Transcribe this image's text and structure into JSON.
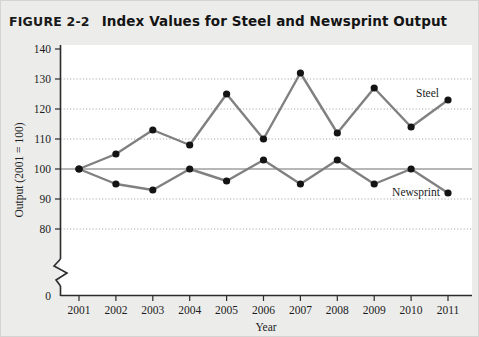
{
  "figure": {
    "number": "FIGURE 2-2",
    "title": "Index Values for Steel and Newsprint Output"
  },
  "chart_data": {
    "type": "line",
    "title": "Index Values for Steel and Newsprint Output",
    "xlabel": "Year",
    "ylabel": "Output (2001 = 100)",
    "categories": [
      "2001",
      "2002",
      "2003",
      "2004",
      "2005",
      "2006",
      "2007",
      "2008",
      "2009",
      "2010",
      "2011"
    ],
    "x": [
      2001,
      2002,
      2003,
      2004,
      2005,
      2006,
      2007,
      2008,
      2009,
      2010,
      2011
    ],
    "series": [
      {
        "name": "Steel",
        "color": "#808080",
        "marker_color": "#141414",
        "values": [
          100,
          105,
          113,
          108,
          125,
          110,
          132,
          112,
          127,
          114,
          123
        ]
      },
      {
        "name": "Newsprint",
        "color": "#808080",
        "marker_color": "#141414",
        "values": [
          100,
          95,
          93,
          100,
          96,
          103,
          95,
          103,
          95,
          100,
          92
        ]
      }
    ],
    "ytick_labels": [
      "0",
      "80",
      "90",
      "100",
      "110",
      "120",
      "130",
      "140"
    ],
    "ytick_values": [
      0,
      80,
      90,
      100,
      110,
      120,
      130,
      140
    ],
    "ylim": [
      80,
      140
    ],
    "axis_break": true,
    "grid": "dotted-horizontal",
    "reference_line": 100,
    "legend": "inline-series-labels",
    "annotations": [
      {
        "text": "Steel",
        "series": "Steel"
      },
      {
        "text": "Newsprint",
        "series": "Newsprint"
      }
    ]
  },
  "colors": {
    "page_background": "#ececeb",
    "plot_background": "#ffffff",
    "axis": "#2b2b2b",
    "gridline": "#9a9a9a",
    "line": "#808080",
    "marker": "#141414",
    "reference_line": "#6e6e6e"
  }
}
